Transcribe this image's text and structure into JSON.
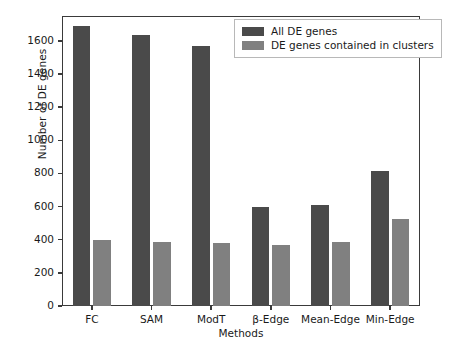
{
  "chart_data": {
    "type": "bar",
    "title": "",
    "xlabel": "Methods",
    "ylabel": "Number of DE genes",
    "categories": [
      "FC",
      "SAM",
      "ModT",
      "β-Edge",
      "Mean-Edge",
      "Min-Edge"
    ],
    "series": [
      {
        "name": "All DE genes",
        "color": "#4a4a4a",
        "values": [
          1690,
          1635,
          1568,
          595,
          608,
          812
        ]
      },
      {
        "name": "DE genes contained in clusters",
        "color": "#808080",
        "values": [
          397,
          389,
          379,
          370,
          384,
          522
        ]
      }
    ],
    "ylim": [
      0,
      1750
    ],
    "yticks": [
      0,
      200,
      400,
      600,
      800,
      1000,
      1200,
      1400,
      1600
    ],
    "ytick_labels": [
      "0",
      "200",
      "400",
      "600",
      "800",
      "1000",
      "1200",
      "1400",
      "1600"
    ],
    "grid": false,
    "legend_position": "upper right",
    "legend_entries": [
      "All DE genes",
      "DE genes contained in clusters"
    ],
    "axis_color": "#3a3a3a",
    "background_color": "#ffffff"
  }
}
